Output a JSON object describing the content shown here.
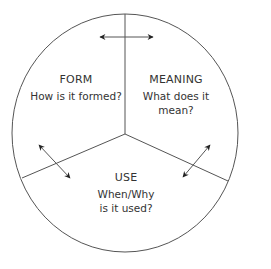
{
  "diagram": {
    "segments": [
      {
        "id": "form",
        "title": "FORM",
        "question": "How is it formed?"
      },
      {
        "id": "meaning",
        "title": "MEANING",
        "question_line1": "What does it",
        "question_line2": "mean?"
      },
      {
        "id": "use",
        "title": "USE",
        "question_line1": "When/Why",
        "question_line2": "is it used?"
      }
    ],
    "arrows": [
      {
        "between": [
          "form",
          "meaning"
        ],
        "type": "double-headed"
      },
      {
        "between": [
          "form",
          "use"
        ],
        "type": "double-headed"
      },
      {
        "between": [
          "meaning",
          "use"
        ],
        "type": "double-headed"
      }
    ],
    "colors": {
      "stroke": "#555555",
      "text": "#333333",
      "background": "#ffffff"
    }
  }
}
